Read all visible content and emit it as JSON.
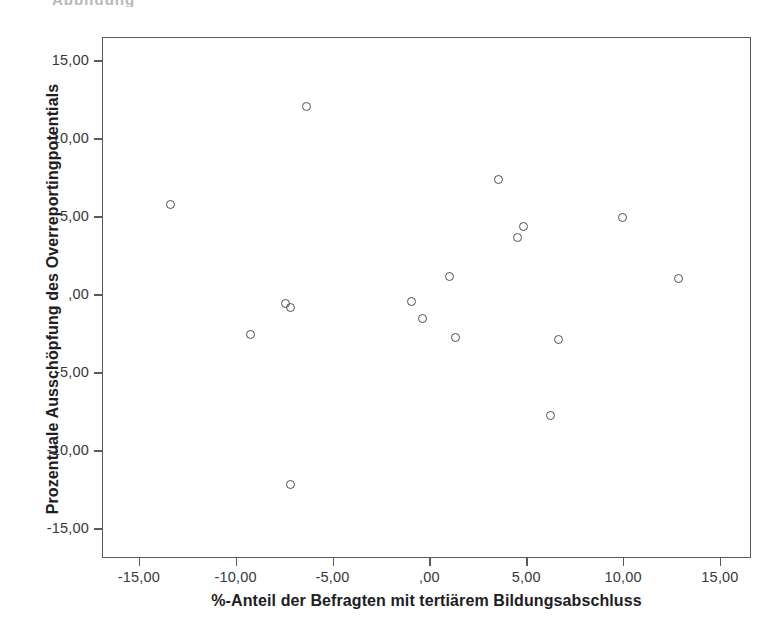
{
  "caption_fragment": "Abbildung",
  "chart_data": {
    "type": "scatter",
    "title": "",
    "xlabel": "%-Anteil der Befragten mit tertiärem Bildungsabschluss",
    "ylabel": "Prozentuale Ausschöpfung des Overreportingpotentials",
    "xlim": [
      -16.9,
      16.6
    ],
    "ylim": [
      -16.9,
      16.5
    ],
    "xticks": [
      -15,
      -10,
      -5,
      0,
      5,
      10,
      15
    ],
    "yticks": [
      -15,
      -10,
      -5,
      0,
      5,
      10,
      15
    ],
    "xticklabels": [
      "-15,00",
      "-10,00",
      "-5,00",
      ",00",
      "5,00",
      "10,00",
      "15,00"
    ],
    "yticklabels": [
      "-15,00",
      "-10,00",
      "-5,00",
      ",00",
      "5,00",
      "10,00",
      "15,00"
    ],
    "grid": false,
    "legend": null,
    "marker": "open-circle",
    "marker_color": "#4a4f54",
    "n_points": 17,
    "points": [
      {
        "x": -13.4,
        "y": 5.8
      },
      {
        "x": -9.3,
        "y": -2.5
      },
      {
        "x": -7.5,
        "y": -0.5
      },
      {
        "x": -7.2,
        "y": -0.8
      },
      {
        "x": -7.2,
        "y": -12.1
      },
      {
        "x": -6.4,
        "y": 12.1
      },
      {
        "x": -1.0,
        "y": -0.4
      },
      {
        "x": -0.4,
        "y": -1.5
      },
      {
        "x": 1.0,
        "y": 1.2
      },
      {
        "x": 1.3,
        "y": -2.7
      },
      {
        "x": 3.5,
        "y": 7.4
      },
      {
        "x": 4.5,
        "y": 3.7
      },
      {
        "x": 4.8,
        "y": 4.4
      },
      {
        "x": 6.2,
        "y": -7.7
      },
      {
        "x": 6.6,
        "y": -2.8
      },
      {
        "x": 9.9,
        "y": 5.0
      },
      {
        "x": 12.8,
        "y": 1.1
      }
    ]
  }
}
